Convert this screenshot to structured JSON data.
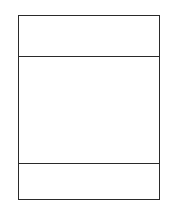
{
  "diagram": {
    "type": "three-compartment-box",
    "sections": [
      {
        "id": "top",
        "label": ""
      },
      {
        "id": "middle",
        "label": ""
      },
      {
        "id": "bottom",
        "label": ""
      }
    ],
    "colors": {
      "border": "#2a2a2a",
      "background": "#ffffff"
    }
  }
}
